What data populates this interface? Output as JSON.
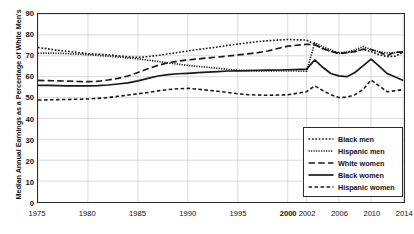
{
  "chart_data": {
    "type": "line",
    "title": "",
    "xlabel": "",
    "ylabel": "Median Annual Earnings as a Percentage of White Men's",
    "ylim": [
      0,
      90
    ],
    "yticks": [
      0,
      10,
      20,
      30,
      40,
      50,
      60,
      70,
      80,
      90
    ],
    "xticks": [
      1975,
      1980,
      1985,
      1990,
      1995,
      2000,
      2002,
      2006,
      2010,
      2014
    ],
    "xtick_labels": [
      "1975",
      "1980",
      "1985",
      "1990",
      "1995",
      "2000",
      "2002",
      "2006",
      "2010",
      "2014"
    ],
    "xtick_bold": [
      false,
      false,
      false,
      false,
      false,
      true,
      false,
      false,
      false,
      false
    ],
    "grid": true,
    "legend_position": "bottom-right",
    "x": [
      1975,
      1976,
      1977,
      1978,
      1979,
      1980,
      1981,
      1982,
      1983,
      1984,
      1985,
      1986,
      1987,
      1988,
      1989,
      1990,
      1991,
      1992,
      1993,
      1994,
      1995,
      1996,
      1997,
      1998,
      1999,
      2000,
      2002,
      2003,
      2004,
      2005,
      2006,
      2007,
      2008,
      2009,
      2010,
      2011,
      2012,
      2013,
      2014
    ],
    "series": [
      {
        "name": "Black men",
        "style": "dotted",
        "values": [
          74.0,
          73.3,
          72.6,
          72.1,
          71.6,
          71.0,
          70.8,
          70.5,
          70.0,
          69.5,
          69.2,
          69.6,
          70.2,
          70.9,
          71.6,
          72.3,
          73.0,
          73.6,
          74.2,
          75.0,
          75.6,
          76.2,
          76.8,
          77.2,
          77.5,
          77.8,
          77.5,
          75.5,
          73.4,
          72.1,
          71.6,
          71.6,
          72.2,
          73.1,
          72.0,
          70.5,
          69.6,
          69.8,
          71.7
        ]
      },
      {
        "name": "Hispanic men",
        "style": "fine-dotted",
        "values": [
          71.2,
          71.3,
          71.2,
          71.0,
          70.8,
          70.5,
          70.2,
          69.8,
          69.4,
          69.0,
          68.5,
          67.9,
          67.3,
          66.6,
          66.0,
          65.4,
          64.9,
          64.5,
          64.0,
          63.5,
          63.0,
          62.9,
          62.8,
          62.8,
          62.8,
          62.8,
          62.6,
          76.2,
          74.3,
          72.9,
          71.1,
          71.8,
          72.8,
          74.4,
          73.0,
          71.9,
          71.4,
          71.5,
          72.0
        ]
      },
      {
        "name": "White women",
        "style": "dashed",
        "values": [
          58.2,
          58.1,
          58.0,
          57.9,
          57.7,
          57.6,
          57.8,
          58.4,
          59.2,
          60.3,
          62.0,
          63.8,
          65.4,
          66.6,
          67.4,
          68.0,
          68.5,
          69.0,
          69.4,
          69.9,
          70.4,
          70.9,
          71.5,
          72.3,
          73.5,
          74.6,
          75.5,
          75.3,
          73.5,
          72.2,
          71.0,
          71.5,
          72.0,
          73.1,
          73.0,
          71.8,
          70.1,
          71.8,
          71.7
        ]
      },
      {
        "name": "Black women",
        "style": "solid",
        "values": [
          55.8,
          55.8,
          55.7,
          55.6,
          55.6,
          55.6,
          55.7,
          56.0,
          56.5,
          57.0,
          58.0,
          59.2,
          60.3,
          61.0,
          61.4,
          61.6,
          61.9,
          62.2,
          62.4,
          62.7,
          62.8,
          62.9,
          63.0,
          63.1,
          63.2,
          63.3,
          63.6,
          68.0,
          64.5,
          61.5,
          60.4,
          60.0,
          62.0,
          65.2,
          68.4,
          65.0,
          61.5,
          59.8,
          58.2
        ]
      },
      {
        "name": "Hispanic women",
        "style": "dashed-fine",
        "values": [
          48.8,
          48.9,
          49.0,
          49.1,
          49.2,
          49.3,
          49.6,
          50.0,
          50.6,
          51.2,
          51.8,
          52.4,
          53.2,
          53.8,
          54.2,
          54.4,
          54.0,
          53.5,
          53.0,
          52.4,
          51.8,
          51.4,
          51.2,
          51.1,
          51.2,
          51.3,
          52.8,
          55.6,
          53.4,
          51.4,
          50.0,
          50.2,
          51.4,
          53.8,
          58.4,
          55.6,
          52.8,
          53.3,
          53.8
        ]
      }
    ]
  },
  "legend": {
    "items": [
      {
        "label": "Black men",
        "style": "dotted"
      },
      {
        "label": "Hispanic men",
        "style": "fine-dotted"
      },
      {
        "label": "White women",
        "style": "dashed"
      },
      {
        "label": "Black women",
        "style": "solid"
      },
      {
        "label": "Hispanic women",
        "style": "dashed-fine"
      }
    ]
  },
  "colors": {
    "line": "#1a1a1a",
    "grid": "#c9c9c9",
    "frame": "#2b2b2b",
    "text": "#111111"
  }
}
